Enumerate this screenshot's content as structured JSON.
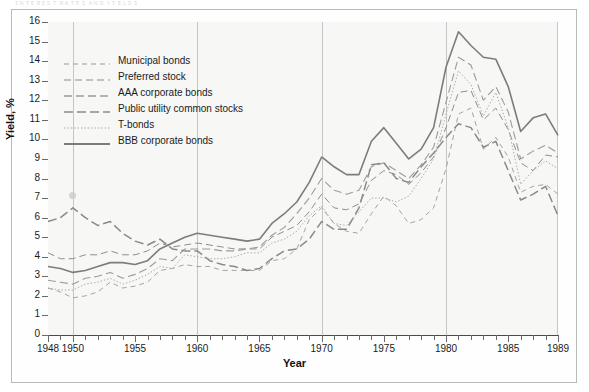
{
  "caption": "ＩＮＴＥＲＥＳＴ ＲＡＴＥＳ ＡＮＤ ＹＩＥＬＤＳ",
  "chart_data": {
    "type": "line",
    "title": "",
    "xlabel": "Year",
    "ylabel": "Yield, %",
    "ylim": [
      0,
      16
    ],
    "xlim": [
      1948,
      1989
    ],
    "grid": "vertical-decades",
    "legend_position": "upper-left-inside",
    "ytick_labels": [
      "0",
      "1",
      "2",
      "3",
      "4",
      "5",
      "6",
      "7",
      "8",
      "9",
      "10",
      "11",
      "12",
      "13",
      "14",
      "15",
      "16"
    ],
    "xtick_labels": [
      "1948",
      "1950",
      "1955",
      "1960",
      "1965",
      "1970",
      "1975",
      "1980",
      "1985",
      "1989"
    ],
    "x": [
      1948,
      1949,
      1950,
      1951,
      1952,
      1953,
      1954,
      1955,
      1956,
      1957,
      1958,
      1959,
      1960,
      1961,
      1962,
      1963,
      1964,
      1965,
      1966,
      1967,
      1968,
      1969,
      1970,
      1971,
      1972,
      1973,
      1974,
      1975,
      1976,
      1977,
      1978,
      1979,
      1980,
      1981,
      1982,
      1983,
      1984,
      1985,
      1986,
      1987,
      1988,
      1989
    ],
    "series": [
      {
        "name": "Municipal bonds",
        "color": "#9a9a96",
        "style": "dashed-fine",
        "values": [
          2.4,
          2.2,
          1.9,
          2.0,
          2.2,
          2.7,
          2.4,
          2.5,
          2.7,
          3.3,
          3.4,
          3.6,
          3.5,
          3.5,
          3.3,
          3.3,
          3.3,
          3.3,
          3.8,
          3.9,
          4.4,
          5.9,
          6.5,
          5.7,
          5.3,
          5.2,
          6.2,
          7.1,
          6.6,
          5.7,
          5.9,
          6.5,
          8.5,
          11.3,
          11.6,
          9.5,
          10.1,
          9.1,
          7.3,
          7.6,
          7.7,
          7.2
        ]
      },
      {
        "name": "Preferred stock",
        "color": "#8e8e8a",
        "style": "dashed-small",
        "values": [
          4.2,
          3.9,
          3.9,
          4.1,
          4.1,
          4.3,
          4.1,
          4.1,
          4.3,
          4.7,
          4.5,
          4.6,
          4.7,
          4.6,
          4.5,
          4.4,
          4.4,
          4.4,
          5.0,
          5.3,
          5.6,
          6.3,
          7.2,
          6.5,
          6.4,
          6.7,
          7.9,
          8.4,
          8.2,
          7.7,
          8.3,
          9.1,
          10.6,
          12.4,
          12.5,
          11.0,
          11.6,
          10.5,
          8.8,
          8.4,
          9.2,
          9.1
        ]
      },
      {
        "name": "AAA corporate bonds",
        "color": "#9c9c97",
        "style": "dashed-med",
        "values": [
          2.8,
          2.7,
          2.6,
          2.9,
          3.0,
          3.2,
          2.9,
          3.1,
          3.4,
          3.9,
          3.8,
          4.4,
          4.4,
          4.4,
          4.3,
          4.3,
          4.4,
          4.5,
          5.1,
          5.5,
          6.2,
          7.0,
          8.0,
          7.4,
          7.2,
          7.4,
          8.6,
          8.8,
          8.4,
          8.0,
          8.7,
          9.6,
          11.9,
          14.2,
          13.8,
          12.0,
          12.7,
          11.4,
          9.0,
          9.4,
          9.7,
          9.3
        ]
      },
      {
        "name": "Public utility common stocks",
        "color": "#8a8a85",
        "style": "dashed-bold",
        "values": [
          5.8,
          6.0,
          6.5,
          6.0,
          5.6,
          5.8,
          5.2,
          4.8,
          4.6,
          4.9,
          4.4,
          4.3,
          4.3,
          3.8,
          3.6,
          3.5,
          3.3,
          3.4,
          3.9,
          4.3,
          4.4,
          4.9,
          5.8,
          5.4,
          5.4,
          6.5,
          8.7,
          8.8,
          8.0,
          7.8,
          8.6,
          9.3,
          10.1,
          10.8,
          10.6,
          9.6,
          9.9,
          8.4,
          6.9,
          7.2,
          7.6,
          6.1
        ]
      },
      {
        "name": "T-bonds",
        "color": "#a8a8a3",
        "style": "dotted",
        "values": [
          2.4,
          2.3,
          2.3,
          2.6,
          2.7,
          2.9,
          2.6,
          2.8,
          3.1,
          3.5,
          3.4,
          4.1,
          4.0,
          3.9,
          3.9,
          4.0,
          4.2,
          4.2,
          4.7,
          4.9,
          5.3,
          6.1,
          6.6,
          5.7,
          5.6,
          6.3,
          7.0,
          7.0,
          6.8,
          7.1,
          8.0,
          9.0,
          11.3,
          13.5,
          12.8,
          11.2,
          12.4,
          10.6,
          7.7,
          8.4,
          8.9,
          8.5
        ]
      },
      {
        "name": "BBB corporate bonds",
        "color": "#7d7d78",
        "style": "solid",
        "values": [
          3.5,
          3.4,
          3.2,
          3.3,
          3.5,
          3.7,
          3.7,
          3.6,
          3.8,
          4.4,
          4.7,
          5.0,
          5.2,
          5.1,
          5.0,
          4.9,
          4.8,
          4.9,
          5.7,
          6.2,
          6.8,
          7.8,
          9.1,
          8.6,
          8.2,
          8.2,
          9.9,
          10.6,
          9.8,
          9.0,
          9.5,
          10.6,
          13.7,
          15.5,
          14.8,
          14.2,
          14.1,
          12.7,
          10.4,
          11.1,
          11.3,
          10.2
        ]
      }
    ]
  }
}
